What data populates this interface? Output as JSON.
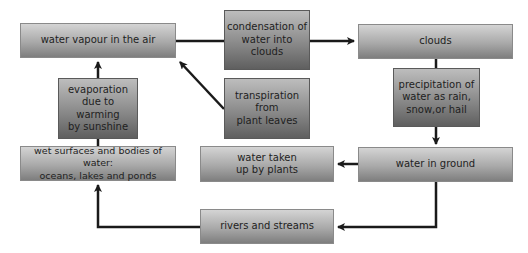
{
  "diagram": {
    "type": "water-cycle-flowchart",
    "nodes": {
      "vapour": "water vapour in the air",
      "condensation": "condensation of\nwater into clouds",
      "clouds": "clouds",
      "evaporation": "evaporation\ndue to\nwarming\nby sunshine",
      "transpiration": "transpiration\nfrom\nplant leaves",
      "precipitation": "precipitation of\nwater as rain,\nsnow,or hail",
      "wet_surfaces": "wet surfaces and bodies of water:\noceans, lakes and ponds",
      "plants": "water taken\nup by plants",
      "ground": "water in ground",
      "rivers": "rivers and streams"
    },
    "edges": [
      {
        "from": "water vapour in the air",
        "to": "clouds",
        "label": "condensation of water into clouds"
      },
      {
        "from": "clouds",
        "to": "water in ground",
        "label": "precipitation of water as rain, snow,or hail"
      },
      {
        "from": "water in ground",
        "to": "water taken up by plants"
      },
      {
        "from": "water in ground",
        "to": "rivers and streams"
      },
      {
        "from": "rivers and streams",
        "to": "wet surfaces and bodies of water: oceans, lakes and ponds"
      },
      {
        "from": "wet surfaces and bodies of water: oceans, lakes and ponds",
        "to": "water vapour in the air",
        "label": "evaporation due to warming by sunshine"
      },
      {
        "from": "transpiration from plant leaves",
        "to": "water vapour in the air"
      }
    ],
    "colors": {
      "arrow": "#1a1a1a",
      "box_light": "#d4d4d4",
      "box_dark": "#7e7e7e"
    }
  }
}
